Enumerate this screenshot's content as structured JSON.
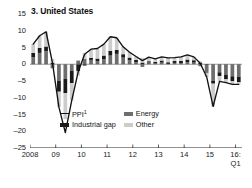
{
  "chart": {
    "title": "3. United States",
    "number_prefix": "3."
  },
  "legend": {
    "position": "inside-bottom-left",
    "entries": [
      {
        "key": "ppi",
        "label": "PPI",
        "sup": "1",
        "marker": "line",
        "color": "#111111"
      },
      {
        "key": "energy",
        "label": "Energy",
        "sup": "",
        "marker": "swatch",
        "color": "#6e6e6e"
      },
      {
        "key": "industrial",
        "label": "Industrial gap",
        "sup": "",
        "marker": "swatch",
        "color": "#1a1a1a"
      },
      {
        "key": "other",
        "label": "Other",
        "sup": "",
        "marker": "swatch",
        "color": "#cccccc"
      }
    ]
  },
  "chart_data": {
    "type": "bar",
    "subtype": "stacked-bar-with-line-overlay",
    "title": "3. United States",
    "xlabel": "",
    "ylabel": "",
    "ylim": [
      -25,
      15
    ],
    "yticks": [
      15,
      10,
      5,
      0,
      -5,
      -10,
      -15,
      -20,
      -25
    ],
    "ytick_labels": [
      "15",
      "10",
      "5",
      "0",
      "–5",
      "–10",
      "–15",
      "–20",
      "–25"
    ],
    "grid": false,
    "zero_line": true,
    "xticks": [
      0,
      4,
      8,
      12,
      16,
      20,
      24,
      28,
      32
    ],
    "xtick_labels": [
      "2008",
      "09",
      "10",
      "11",
      "12",
      "13",
      "14",
      "15",
      "16:\nQ1"
    ],
    "x_axis_note": "quarterly, 2008 Q1 to 2016 Q1",
    "x": [
      "2008Q1",
      "2008Q2",
      "2008Q3",
      "2008Q4",
      "2009Q1",
      "2009Q2",
      "2009Q3",
      "2009Q4",
      "2010Q1",
      "2010Q2",
      "2010Q3",
      "2010Q4",
      "2011Q1",
      "2011Q2",
      "2011Q3",
      "2011Q4",
      "2012Q1",
      "2012Q2",
      "2012Q3",
      "2012Q4",
      "2013Q1",
      "2013Q2",
      "2013Q3",
      "2013Q4",
      "2014Q1",
      "2014Q2",
      "2014Q3",
      "2014Q4",
      "2015Q1",
      "2015Q2",
      "2015Q3",
      "2015Q4",
      "2016Q1"
    ],
    "series": [
      {
        "name": "Energy",
        "color": "#6e6e6e",
        "stacked": true,
        "values": [
          2.1,
          3.4,
          3.9,
          -1.2,
          -5.0,
          -4.4,
          -2.0,
          1.1,
          1.6,
          1.3,
          0.9,
          1.5,
          2.6,
          3.1,
          2.0,
          1.2,
          0.6,
          -0.8,
          0.5,
          0.2,
          0.5,
          0.1,
          0.4,
          0.3,
          0.6,
          0.5,
          -0.6,
          -2.6,
          -4.9,
          -2.4,
          -3.2,
          -3.6,
          -3.7
        ]
      },
      {
        "name": "Industrial gap",
        "color": "#1a1a1a",
        "stacked": true,
        "values": [
          1.3,
          1.5,
          1.4,
          0.4,
          -3.2,
          -4.2,
          -3.6,
          -2.0,
          -0.4,
          0.6,
          0.8,
          1.1,
          1.4,
          1.2,
          1.0,
          0.8,
          0.7,
          0.5,
          0.4,
          0.5,
          0.6,
          0.5,
          0.6,
          0.7,
          0.8,
          0.7,
          0.5,
          0.0,
          -0.9,
          -1.1,
          -1.3,
          -1.5,
          -1.6
        ]
      },
      {
        "name": "Other",
        "color": "#cccccc",
        "stacked": true,
        "values": [
          2.6,
          3.6,
          4.4,
          1.2,
          -4.6,
          -7.8,
          -5.2,
          -1.4,
          1.8,
          2.6,
          3.0,
          3.4,
          4.2,
          3.6,
          2.2,
          1.6,
          1.0,
          1.4,
          1.2,
          0.9,
          1.1,
          1.3,
          1.0,
          1.2,
          1.4,
          1.0,
          0.4,
          -1.2,
          -6.8,
          -1.6,
          -1.0,
          -0.9,
          -0.7
        ]
      }
    ],
    "line_series": {
      "name": "PPI",
      "color": "#111111",
      "values": [
        6.0,
        8.5,
        9.7,
        0.4,
        -12.8,
        -20.4,
        -10.8,
        -2.3,
        3.0,
        4.5,
        4.7,
        6.0,
        8.2,
        7.9,
        5.2,
        3.6,
        2.3,
        1.1,
        2.1,
        1.6,
        2.2,
        1.9,
        2.0,
        2.2,
        2.8,
        2.2,
        0.3,
        -3.8,
        -12.6,
        -5.1,
        -5.5,
        -6.0,
        -6.0
      ]
    }
  }
}
